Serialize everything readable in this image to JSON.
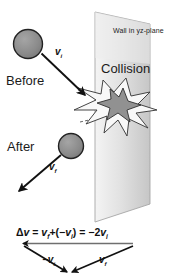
{
  "figure": {
    "background_color": "#ffffff"
  },
  "labels": {
    "before": "Before",
    "after": "After",
    "collision": "Collision",
    "wall": "Wall in yz-plane"
  },
  "vectors": {
    "v_initial_top": "v",
    "v_initial_top_sub": "i",
    "v_final_after": "v",
    "v_final_after_sub": "f",
    "neg_v_initial": "−v",
    "neg_v_initial_sub": "i",
    "v_final_bottom": "v",
    "v_final_bottom_sub": "f"
  },
  "formula": {
    "delta": "Δ",
    "v_bold": "v",
    "eq1": " = ",
    "vf": "v",
    "vf_sub": "f",
    "plus_open": "+(−",
    "vi": "v",
    "vi_sub": "i",
    "close_eq": ") = −2",
    "vi2": "v",
    "vi2_sub": "i",
    "full_text": "Δv = vf+(−vi) = −2vi"
  },
  "colors": {
    "ball_fill": "#8a8a8a",
    "ball_stroke": "#222222",
    "wall_fill_light": "#f2f2f2",
    "wall_fill_dark": "#c9c9c9",
    "wall_stroke": "#9a9a9a",
    "star_outer_fill": "#f7f7f7",
    "star_outer_stroke": "#444444",
    "star_inner_fill": "#8f8f8f",
    "star_inner_stroke": "#333333",
    "arrow_color": "#111111",
    "text_color": "#1b1b1b"
  },
  "geometry": {
    "ball_before": {
      "cx": 28,
      "cy": 44,
      "r": 14
    },
    "ball_after": {
      "cx": 70,
      "cy": 146,
      "r": 12
    },
    "wall_points": "95,12 150,24 150,204 95,222",
    "arrow_vi": {
      "x1": 41,
      "y1": 54,
      "x2": 84,
      "y2": 94
    },
    "arrow_vf": {
      "x1": 60,
      "y1": 155,
      "x2": 20,
      "y2": 190
    },
    "arrow_delta_v": {
      "x1": 133,
      "y1": 243,
      "x2": 22,
      "y2": 243
    },
    "arrow_triangle_left": {
      "x1": 24,
      "y1": 245,
      "x2": 66,
      "y2": 271
    },
    "arrow_triangle_right": {
      "x1": 133,
      "y1": 245,
      "x2": 69,
      "y2": 272
    }
  }
}
